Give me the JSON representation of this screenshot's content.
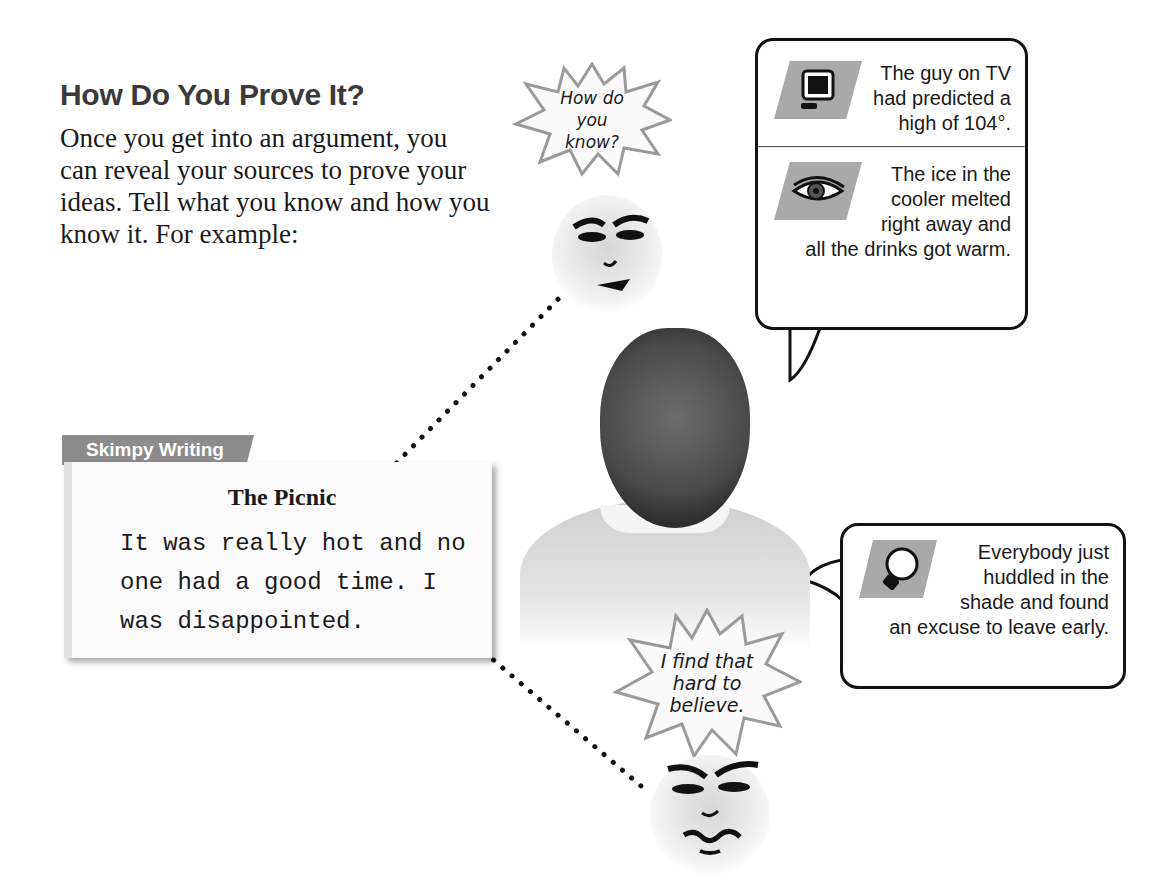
{
  "heading": "How Do You Prove It?",
  "intro": "Once you get into an argument, you can reveal your sources to prove your ideas. Tell what you know and how you know it. For example:",
  "skimpy": {
    "tab_label": "Skimpy Writing",
    "title": "The Picnic",
    "body": "It was really hot and no one had a good time. I was disappointed."
  },
  "face_top": {
    "speech": "How do you know?"
  },
  "face_bottom": {
    "speech": "I find that hard to believe."
  },
  "evidence": [
    {
      "icon": "tv-icon",
      "sense": "heard/saw",
      "text": "The guy on TV had predicted a high of 104°."
    },
    {
      "icon": "eye-icon",
      "sense": "saw",
      "text": "The ice in the cooler melted right away and all the drinks got warm."
    },
    {
      "icon": "lightbulb-icon",
      "sense": "thought",
      "text": "Everybody just huddled in the shade and found an excuse to leave early."
    }
  ]
}
